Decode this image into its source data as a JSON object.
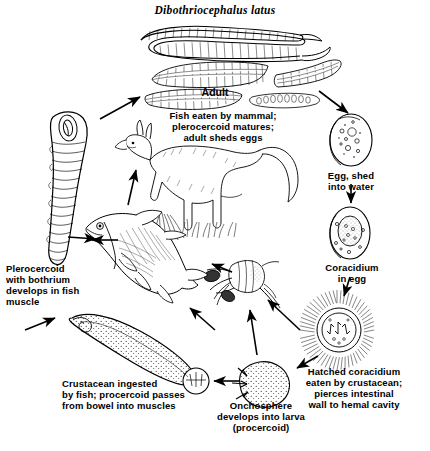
{
  "figure": {
    "title": "Dibothriocephalus latus",
    "kind": "parasite-life-cycle-diagram",
    "background_color": "#ffffff",
    "ink_color": "#000000"
  },
  "labels": {
    "adult": "Adult",
    "fish_eaten": "Fish eaten by mammal;\nplerocercoid matures;\nadult sheds eggs",
    "egg_shed": "Egg, shed\ninto water",
    "coracidium_in_egg": "Coracidium\nin egg",
    "hatched_coracidium": "Hatched coracidium\neaten by crustacean;\npierces intestinal\nwall to hemal cavity",
    "onchosphere": "Onchosphere\ndevelops into larva\n(procercoid)",
    "crustacean_ingested": "Crustacean ingested\nby fish; procercoid passes\nfrom bowel into muscles",
    "plerocercoid": "Plerocercoid\nwith bothrium\ndevelops in fish\nmuscle"
  },
  "stages": [
    {
      "id": "adult-worm",
      "name": "Adult tapeworm (strobila and proglottids)"
    },
    {
      "id": "mammal-host",
      "name": "Definitive mammal host (canid)"
    },
    {
      "id": "egg",
      "name": "Operculate egg shed into water"
    },
    {
      "id": "coracidium-egg",
      "name": "Coracidium developing inside egg"
    },
    {
      "id": "coracidium-hatched",
      "name": "Hatched ciliated coracidium"
    },
    {
      "id": "onchosphere",
      "name": "Onchosphere with hooks"
    },
    {
      "id": "procercoid",
      "name": "Procercoid larva in crustacean"
    },
    {
      "id": "copepod",
      "name": "Crustacean (copepod) intermediate host"
    },
    {
      "id": "fish",
      "name": "Fish second intermediate host"
    },
    {
      "id": "plerocercoid",
      "name": "Plerocercoid with bothrium"
    }
  ],
  "arrows": [
    {
      "from": "plerocercoid-fish",
      "to": "adult-worm"
    },
    {
      "from": "adult-worm",
      "to": "egg"
    },
    {
      "from": "egg",
      "to": "coracidium-egg"
    },
    {
      "from": "coracidium-egg",
      "to": "coracidium-hatched"
    },
    {
      "from": "coracidium-hatched",
      "to": "onchosphere"
    },
    {
      "from": "onchosphere",
      "to": "copepod"
    },
    {
      "from": "copepod",
      "to": "procercoid"
    },
    {
      "from": "procercoid",
      "to": "fish"
    },
    {
      "from": "fish",
      "to": "plerocercoid"
    }
  ]
}
